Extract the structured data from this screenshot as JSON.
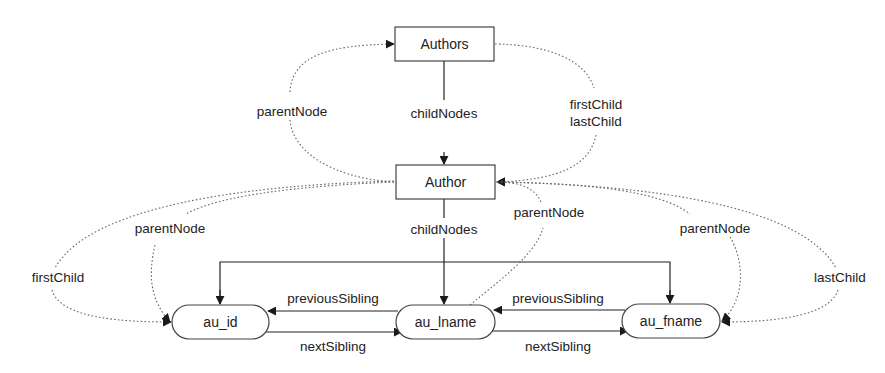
{
  "nodes": {
    "authors": "Authors",
    "author": "Author",
    "au_id": "au_id",
    "au_lname": "au_lname",
    "au_fname": "au_fname"
  },
  "edges": {
    "authors_parentNode": "parentNode",
    "authors_childNodes": "childNodes",
    "authors_firstChild": "firstChild",
    "authors_lastChild": "lastChild",
    "author_childNodes": "childNodes",
    "au_id_parentNode": "parentNode",
    "au_id_firstChild": "firstChild",
    "au_lname_parentNode": "parentNode",
    "au_fname_parentNode": "parentNode",
    "au_fname_lastChild": "lastChild",
    "previousSibling_1": "previousSibling",
    "nextSibling_1": "nextSibling",
    "previousSibling_2": "previousSibling",
    "nextSibling_2": "nextSibling"
  },
  "colors": {
    "stroke": "#222222",
    "dotted": "#666666",
    "background": "#ffffff"
  }
}
